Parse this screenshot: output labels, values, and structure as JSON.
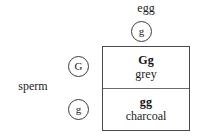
{
  "figure": {
    "type": "punnett-square",
    "background_color": "#ffffff",
    "border_color": "#4a4a4a"
  },
  "egg": {
    "label": "egg",
    "gamete": "g"
  },
  "sperm": {
    "label": "sperm",
    "gametes": [
      {
        "allele": "G"
      },
      {
        "allele": "g"
      }
    ]
  },
  "punnett": {
    "cells": [
      {
        "genotype": "Gg",
        "phenotype": "grey"
      },
      {
        "genotype": "gg",
        "phenotype": "charcoal"
      }
    ]
  }
}
